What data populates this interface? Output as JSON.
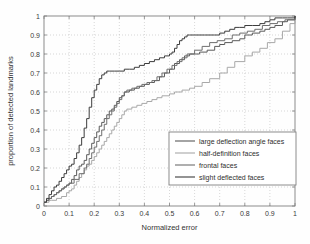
{
  "chart_data": {
    "type": "line",
    "title": "",
    "subtitle": "",
    "xlabel": "Normalized error",
    "ylabel": "proportion of detected landmarks",
    "xlim": [
      0,
      1
    ],
    "ylim": [
      0,
      1
    ],
    "grid": true,
    "grid_style": "dotted",
    "legend_position": "lower-right",
    "xticks": [
      "0",
      "0.1",
      "0.2",
      "0.3",
      "0.4",
      "0.5",
      "0.6",
      "0.7",
      "0.8",
      "0.9",
      "1"
    ],
    "yticks": [
      "0",
      "0.1",
      "0.2",
      "0.3",
      "0.4",
      "0.5",
      "0.6",
      "0.7",
      "0.8",
      "0.9",
      "1"
    ],
    "xtick_values": [
      0,
      0.1,
      0.2,
      0.3,
      0.4,
      0.5,
      0.6,
      0.7,
      0.8,
      0.9,
      1
    ],
    "ytick_values": [
      0,
      0.1,
      0.2,
      0.3,
      0.4,
      0.5,
      0.6,
      0.7,
      0.8,
      0.9,
      1
    ],
    "series": [
      {
        "name": "large deflection angle faces",
        "color": "#5a5a5a",
        "x": [
          0.0,
          0.01,
          0.02,
          0.03,
          0.04,
          0.05,
          0.06,
          0.07,
          0.08,
          0.09,
          0.1,
          0.11,
          0.12,
          0.13,
          0.14,
          0.15,
          0.16,
          0.17,
          0.18,
          0.19,
          0.2,
          0.21,
          0.22,
          0.23,
          0.24,
          0.25,
          0.26,
          0.27,
          0.28,
          0.29,
          0.3,
          0.31,
          0.32,
          0.34,
          0.36,
          0.38,
          0.4,
          0.42,
          0.44,
          0.46,
          0.48,
          0.5,
          0.52,
          0.54,
          0.56,
          0.58,
          0.6,
          0.62,
          0.65,
          0.68,
          0.7,
          0.72,
          0.75,
          0.78,
          0.8,
          0.83,
          0.86,
          0.88,
          0.9,
          0.92,
          0.95,
          0.97,
          1.0
        ],
        "y": [
          0.02,
          0.03,
          0.04,
          0.05,
          0.06,
          0.07,
          0.08,
          0.09,
          0.1,
          0.11,
          0.12,
          0.14,
          0.16,
          0.19,
          0.21,
          0.22,
          0.24,
          0.27,
          0.3,
          0.33,
          0.36,
          0.39,
          0.42,
          0.44,
          0.46,
          0.48,
          0.5,
          0.51,
          0.53,
          0.55,
          0.57,
          0.58,
          0.6,
          0.61,
          0.62,
          0.63,
          0.64,
          0.65,
          0.66,
          0.68,
          0.7,
          0.72,
          0.75,
          0.77,
          0.79,
          0.8,
          0.8,
          0.81,
          0.82,
          0.84,
          0.85,
          0.86,
          0.87,
          0.88,
          0.9,
          0.91,
          0.92,
          0.93,
          0.94,
          0.95,
          0.97,
          0.98,
          1.0
        ]
      },
      {
        "name": "half-definition faces",
        "color": "#a8a8a8",
        "x": [
          0.0,
          0.01,
          0.02,
          0.03,
          0.05,
          0.07,
          0.09,
          0.1,
          0.11,
          0.12,
          0.13,
          0.14,
          0.15,
          0.16,
          0.17,
          0.18,
          0.19,
          0.2,
          0.21,
          0.22,
          0.23,
          0.24,
          0.25,
          0.26,
          0.27,
          0.28,
          0.29,
          0.3,
          0.31,
          0.32,
          0.33,
          0.35,
          0.37,
          0.39,
          0.41,
          0.43,
          0.45,
          0.47,
          0.5,
          0.52,
          0.55,
          0.58,
          0.6,
          0.63,
          0.66,
          0.7,
          0.73,
          0.76,
          0.8,
          0.83,
          0.86,
          0.89,
          0.92,
          0.95,
          0.98,
          1.0
        ],
        "y": [
          0.02,
          0.02,
          0.03,
          0.03,
          0.04,
          0.05,
          0.07,
          0.08,
          0.09,
          0.11,
          0.13,
          0.15,
          0.17,
          0.19,
          0.21,
          0.22,
          0.24,
          0.26,
          0.28,
          0.3,
          0.32,
          0.34,
          0.36,
          0.38,
          0.4,
          0.42,
          0.44,
          0.46,
          0.48,
          0.5,
          0.51,
          0.52,
          0.53,
          0.54,
          0.55,
          0.56,
          0.57,
          0.58,
          0.59,
          0.6,
          0.61,
          0.62,
          0.63,
          0.65,
          0.67,
          0.7,
          0.73,
          0.76,
          0.79,
          0.81,
          0.83,
          0.86,
          0.88,
          0.92,
          0.96,
          0.98
        ]
      },
      {
        "name": "frontal faces",
        "color": "#6e6e6e",
        "x": [
          0.0,
          0.01,
          0.02,
          0.03,
          0.04,
          0.05,
          0.06,
          0.07,
          0.08,
          0.09,
          0.1,
          0.12,
          0.14,
          0.16,
          0.17,
          0.18,
          0.19,
          0.2,
          0.21,
          0.22,
          0.23,
          0.24,
          0.25,
          0.26,
          0.27,
          0.28,
          0.29,
          0.3,
          0.31,
          0.32,
          0.33,
          0.35,
          0.37,
          0.39,
          0.41,
          0.43,
          0.45,
          0.47,
          0.49,
          0.51,
          0.53,
          0.55,
          0.57,
          0.6,
          0.63,
          0.66,
          0.69,
          0.72,
          0.75,
          0.78,
          0.81,
          0.84,
          0.87,
          0.9,
          0.93,
          0.96,
          1.0
        ],
        "y": [
          0.02,
          0.03,
          0.04,
          0.05,
          0.06,
          0.07,
          0.08,
          0.09,
          0.1,
          0.11,
          0.12,
          0.14,
          0.17,
          0.2,
          0.22,
          0.25,
          0.28,
          0.31,
          0.34,
          0.37,
          0.4,
          0.43,
          0.46,
          0.48,
          0.5,
          0.52,
          0.54,
          0.56,
          0.58,
          0.6,
          0.61,
          0.62,
          0.63,
          0.64,
          0.65,
          0.66,
          0.68,
          0.7,
          0.72,
          0.74,
          0.76,
          0.78,
          0.8,
          0.82,
          0.84,
          0.86,
          0.87,
          0.88,
          0.9,
          0.91,
          0.92,
          0.93,
          0.95,
          0.96,
          0.97,
          0.98,
          1.0
        ]
      },
      {
        "name": "slight deflected faces",
        "color": "#3d3d3d",
        "x": [
          0.0,
          0.01,
          0.02,
          0.03,
          0.04,
          0.05,
          0.06,
          0.07,
          0.08,
          0.09,
          0.1,
          0.11,
          0.12,
          0.13,
          0.14,
          0.15,
          0.16,
          0.17,
          0.18,
          0.19,
          0.2,
          0.21,
          0.22,
          0.23,
          0.24,
          0.25,
          0.26,
          0.28,
          0.3,
          0.32,
          0.34,
          0.36,
          0.38,
          0.4,
          0.42,
          0.44,
          0.46,
          0.48,
          0.5,
          0.51,
          0.52,
          0.53,
          0.54,
          0.55,
          0.56,
          0.57,
          0.58,
          0.6,
          0.64,
          0.68,
          0.7,
          0.72,
          0.74,
          0.76,
          0.78,
          0.8,
          0.83,
          0.86,
          0.88,
          0.9,
          0.92,
          0.95,
          0.97,
          1.0
        ],
        "y": [
          0.02,
          0.04,
          0.06,
          0.08,
          0.1,
          0.11,
          0.13,
          0.15,
          0.17,
          0.19,
          0.21,
          0.22,
          0.25,
          0.28,
          0.32,
          0.36,
          0.41,
          0.46,
          0.52,
          0.57,
          0.61,
          0.64,
          0.67,
          0.69,
          0.7,
          0.71,
          0.71,
          0.71,
          0.71,
          0.72,
          0.72,
          0.73,
          0.74,
          0.75,
          0.76,
          0.77,
          0.78,
          0.79,
          0.8,
          0.81,
          0.83,
          0.85,
          0.87,
          0.88,
          0.89,
          0.9,
          0.9,
          0.9,
          0.9,
          0.9,
          0.91,
          0.92,
          0.93,
          0.94,
          0.94,
          0.95,
          0.95,
          0.96,
          0.97,
          0.98,
          0.99,
          0.99,
          0.99,
          1.0
        ]
      }
    ]
  },
  "legend": {
    "items": [
      {
        "label": "large deflection angle faces"
      },
      {
        "label": "half-definition faces"
      },
      {
        "label": "frontal faces"
      },
      {
        "label": "slight deflected faces"
      }
    ]
  },
  "colors": {
    "axis": "#808080",
    "grid": "#bdbdbd",
    "background": "#fefefe",
    "text": "#333333"
  }
}
